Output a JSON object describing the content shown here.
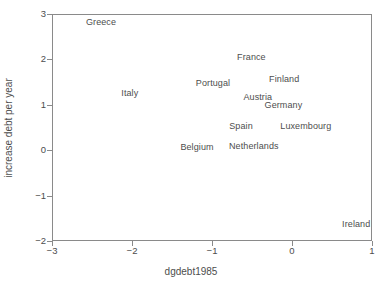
{
  "chart_data": {
    "type": "scatter",
    "title": "",
    "xlabel": "dgdebt1985",
    "ylabel": "increase debt per year",
    "xlim": [
      -3,
      1
    ],
    "ylim": [
      -2,
      3
    ],
    "xticks": [
      "−3",
      "−2",
      "−1",
      "0",
      "1"
    ],
    "xtick_values": [
      -3,
      -2,
      -1,
      0,
      1
    ],
    "yticks": [
      "3",
      "2",
      "1",
      "0",
      "−1",
      "−2"
    ],
    "ytick_values": [
      3,
      2,
      1,
      0,
      -1,
      -2
    ],
    "grid": false,
    "legend": null,
    "marker_style": "text-labels-only",
    "points": [
      {
        "label": "Greece",
        "x": -2.4,
        "y": 2.85
      },
      {
        "label": "France",
        "x": -0.52,
        "y": 2.08
      },
      {
        "label": "Finland",
        "x": -0.11,
        "y": 1.6
      },
      {
        "label": "Portugal",
        "x": -1.0,
        "y": 1.5
      },
      {
        "label": "Italy",
        "x": -2.04,
        "y": 1.29
      },
      {
        "label": "Austria",
        "x": -0.44,
        "y": 1.2
      },
      {
        "label": "Germany",
        "x": -0.12,
        "y": 1.02
      },
      {
        "label": "Spain",
        "x": -0.65,
        "y": 0.56
      },
      {
        "label": "Luxembourg",
        "x": 0.16,
        "y": 0.56
      },
      {
        "label": "Netherlands",
        "x": -0.49,
        "y": 0.12
      },
      {
        "label": "Belgium",
        "x": -1.2,
        "y": 0.1
      },
      {
        "label": "Ireland",
        "x": 0.79,
        "y": -1.6
      }
    ]
  },
  "colors": {
    "frame": "#8a8a8a",
    "text": "#4d4d4d",
    "background": "#ffffff"
  }
}
